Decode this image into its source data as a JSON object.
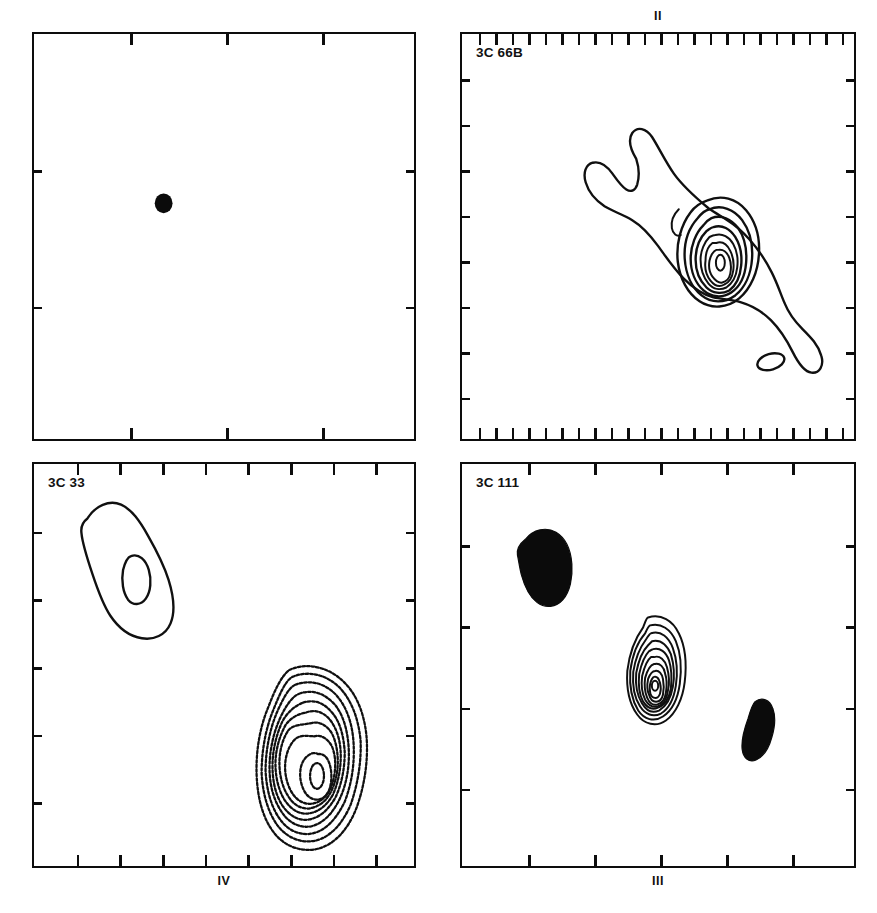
{
  "figure": {
    "kind": "radio-contour-maps",
    "page_width": 877,
    "page_height": 913,
    "background_color": "#ffffff",
    "ink_color": "#101010"
  },
  "panels": [
    {
      "id": "panel-1",
      "position": "top-left",
      "caption": "",
      "source_label": "",
      "ticks": {
        "top": 3,
        "bottom": 3,
        "left": 2,
        "right": 2
      },
      "features": "single unresolved point source marked by a small filled ellipse near the upper-left quadrant"
    },
    {
      "id": "panel-2",
      "position": "top-right",
      "caption": "II",
      "source_label": "3C 66B",
      "ticks": {
        "top": 23,
        "bottom": 23,
        "left": 8,
        "right": 8
      },
      "features": "elongated north-west to south-east jet with a nested multi-level contour core and a small secondary knot south-east of the core"
    },
    {
      "id": "panel-4",
      "position": "bottom-left",
      "caption": "IV",
      "source_label": "3C 33",
      "ticks": {
        "top": 8,
        "bottom": 8,
        "left": 5,
        "right": 5
      },
      "features": "teardrop shaped northern lobe with one inner contour, plus a bright southern lobe drawn with many nested stippled contours"
    },
    {
      "id": "panel-3",
      "position": "bottom-right",
      "caption": "III",
      "source_label": "3C 111",
      "ticks": {
        "top": 5,
        "bottom": 5,
        "left": 4,
        "right": 4
      },
      "features": "two solid filled lobes to the north-west and south-east with a tightly wound concentric contour core at the centre"
    }
  ],
  "chart_data": {
    "type": "contour-map-grid",
    "title": "",
    "layout": {
      "rows": 2,
      "cols": 2,
      "grid_on": false,
      "legend": "none"
    },
    "panel_order": [
      "panel-1",
      "panel-2",
      "panel-4",
      "panel-3"
    ],
    "maps": [
      {
        "panel": "panel-1",
        "label": "",
        "caption": "",
        "components": [
          {
            "name": "point-source",
            "render": "filled",
            "center_frac": [
              0.34,
              0.42
            ],
            "size_frac": [
              0.045,
              0.045
            ],
            "contour_levels": 1
          }
        ],
        "axis": {
          "x_ticks": 3,
          "y_ticks": 2,
          "x_tick_labels": [],
          "y_tick_labels": []
        }
      },
      {
        "panel": "panel-2",
        "label": "3C 66B",
        "caption": "II",
        "components": [
          {
            "name": "jet-envelope",
            "render": "outline",
            "center_frac": [
              0.55,
              0.52
            ],
            "position_angle_deg": 135,
            "contour_levels": 1
          },
          {
            "name": "core",
            "render": "nested-contours",
            "center_frac": [
              0.56,
              0.49
            ],
            "contour_levels": 8
          },
          {
            "name": "secondary-knot",
            "render": "outline",
            "center_frac": [
              0.7,
              0.7
            ],
            "contour_levels": 1
          }
        ],
        "axis": {
          "x_ticks": 23,
          "y_ticks": 8,
          "x_tick_labels": [],
          "y_tick_labels": []
        }
      },
      {
        "panel": "panel-4",
        "label": "3C 33",
        "caption": "IV",
        "components": [
          {
            "name": "northern-lobe",
            "render": "outline",
            "center_frac": [
              0.22,
              0.2
            ],
            "contour_levels": 2
          },
          {
            "name": "southern-lobe",
            "render": "nested-stippled-contours",
            "center_frac": [
              0.7,
              0.72
            ],
            "contour_levels": 9
          }
        ],
        "axis": {
          "x_ticks": 8,
          "y_ticks": 5,
          "x_tick_labels": [],
          "y_tick_labels": []
        }
      },
      {
        "panel": "panel-3",
        "label": "3C 111",
        "caption": "III",
        "components": [
          {
            "name": "north-west-lobe",
            "render": "filled",
            "center_frac": [
              0.18,
              0.24
            ],
            "contour_levels": 1
          },
          {
            "name": "core",
            "render": "nested-contours",
            "center_frac": [
              0.5,
              0.42
            ],
            "contour_levels": 10
          },
          {
            "name": "south-east-lobe",
            "render": "filled",
            "center_frac": [
              0.78,
              0.6
            ],
            "contour_levels": 1
          }
        ],
        "axis": {
          "x_ticks": 5,
          "y_ticks": 4,
          "x_tick_labels": [],
          "y_tick_labels": []
        }
      }
    ]
  }
}
